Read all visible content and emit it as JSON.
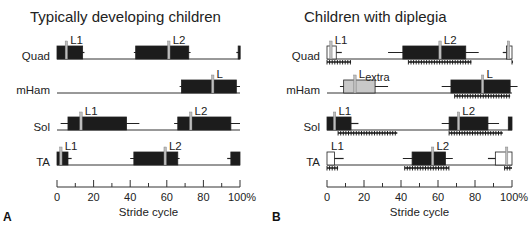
{
  "panels": [
    {
      "id": "A",
      "letter": "A",
      "title": "Typically developing children",
      "axis_label": "Stride cycle",
      "ticks": [
        "0",
        "20",
        "40",
        "60",
        "80",
        "100%"
      ],
      "rows": [
        {
          "muscle": "Quad",
          "bursts": [
            {
              "start": 0,
              "end": 14,
              "fill": "black",
              "marker": 5,
              "label": "L1",
              "whisker": [
                0,
                15
              ]
            },
            {
              "start": 43,
              "end": 72,
              "fill": "black",
              "marker": 61,
              "label": "L2",
              "whisker": [
                42,
                73
              ]
            },
            {
              "start": 99,
              "end": 100,
              "fill": "black",
              "whisker": [
                98,
                100
              ]
            }
          ]
        },
        {
          "muscle": "mHam",
          "bursts": [
            {
              "start": 68,
              "end": 98,
              "fill": "black",
              "marker": 85,
              "label": "L",
              "whisker": [
                67,
                100
              ]
            }
          ]
        },
        {
          "muscle": "Sol",
          "bursts": [
            {
              "start": 6,
              "end": 38,
              "fill": "black",
              "marker": 13,
              "label": "L1",
              "whisker": [
                2,
                45
              ]
            },
            {
              "start": 66,
              "end": 95,
              "fill": "black",
              "marker": 73,
              "label": "L2",
              "whisker": [
                64,
                100
              ]
            }
          ]
        },
        {
          "muscle": "TA",
          "bursts": [
            {
              "start": 0,
              "end": 6,
              "fill": "black",
              "marker": 2,
              "label": "L1",
              "whisker": [
                0,
                8
              ]
            },
            {
              "start": 42,
              "end": 66,
              "fill": "black",
              "marker": 59,
              "label": "L2",
              "whisker": [
                40,
                67
              ]
            },
            {
              "start": 95,
              "end": 100,
              "fill": "black",
              "whisker": [
                93,
                100
              ]
            }
          ]
        }
      ]
    },
    {
      "id": "B",
      "letter": "B",
      "title": "Children with diplegia",
      "axis_label": "Stride cycle",
      "ticks": [
        "0",
        "20",
        "40",
        "60",
        "80",
        "100%"
      ],
      "rows": [
        {
          "muscle": "Quad",
          "bursts": [
            {
              "start": 0,
              "end": 5,
              "fill": "white",
              "marker": 2,
              "label": "L1",
              "whisker": [
                0,
                8
              ]
            },
            {
              "start": 41,
              "end": 75,
              "fill": "black",
              "marker": 61,
              "label": "L2",
              "whisker": [
                33,
                82
              ]
            },
            {
              "start": 97,
              "end": 100,
              "fill": "white",
              "marker": 98,
              "whisker": [
                95,
                100
              ]
            }
          ],
          "significance": [
            [
              0,
              13
            ],
            [
              44,
              78
            ],
            [
              100,
              100
            ]
          ]
        },
        {
          "muscle": "mHam",
          "bursts": [
            {
              "start": 9,
              "end": 26,
              "fill": "grey",
              "marker": 15,
              "label": "Lextra",
              "label_main": "L",
              "label_sub": "extra",
              "whisker": [
                7,
                33
              ]
            },
            {
              "start": 67,
              "end": 99,
              "fill": "black",
              "marker": 84,
              "label": "L",
              "whisker": [
                62,
                103
              ]
            }
          ],
          "significance": [
            [
              69,
              99
            ]
          ]
        },
        {
          "muscle": "Sol",
          "bursts": [
            {
              "start": 0,
              "end": 13,
              "fill": "black",
              "marker": 4,
              "label": "L1",
              "whisker": [
                0,
                17
              ]
            },
            {
              "start": 66,
              "end": 87,
              "fill": "black",
              "marker": 71,
              "label": "L2",
              "whisker": [
                62,
                93
              ]
            },
            {
              "start": 98,
              "end": 100,
              "fill": "black"
            }
          ],
          "significance": [
            [
              6,
              38
            ],
            [
              66,
              95
            ]
          ]
        },
        {
          "muscle": "TA",
          "bursts": [
            {
              "start": 0,
              "end": 4,
              "fill": "white",
              "label": "L1",
              "whisker": [
                0,
                9
              ]
            },
            {
              "start": 46,
              "end": 64,
              "fill": "black",
              "marker": 57,
              "label": "L2",
              "whisker": [
                41,
                68
              ]
            },
            {
              "start": 91,
              "end": 100,
              "fill": "white",
              "marker": 97,
              "whisker": [
                87,
                100
              ]
            }
          ],
          "significance": [
            [
              0,
              6
            ],
            [
              42,
              66
            ],
            [
              96,
              100
            ]
          ]
        }
      ]
    }
  ]
}
